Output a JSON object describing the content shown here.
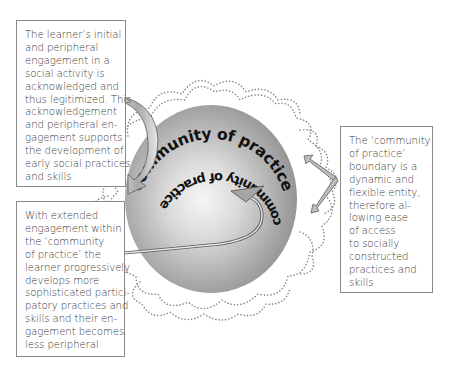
{
  "diagram": {
    "center_label_top": "community of practice",
    "center_label_bottom": "community of practice",
    "colors": {
      "sphere_edge": "#8c8c8c",
      "sphere_highlight": "#f4f4f4",
      "dotted_boundary": "#8a8a8a",
      "arrow_fill": "#b9b9b9",
      "arrow_stroke": "#6a6a6a",
      "label_text": "#111111",
      "box_border": "#8a8a8a",
      "box_text": "#3a3a3a"
    }
  },
  "boxes": {
    "top_left": {
      "lines": [
        "The learner’s initial",
        "and peripheral",
        "engagement in a",
        "social activity is",
        "acknowledged and",
        "thus legitimized. This",
        "acknowledgement",
        "and peripheral en-",
        "gagement supports",
        "the development of",
        "early social practices",
        "and skills"
      ]
    },
    "bottom_left": {
      "lines": [
        "With extended",
        "engagement within",
        "the ‘community",
        "of practice’ the",
        "learner progressively",
        "develops more",
        "sophisticated partici-",
        "patory practices and",
        "skills and their en-",
        "gagement becomes",
        "less peripheral"
      ]
    },
    "right": {
      "lines": [
        "The ‘community",
        "of practice’",
        "boundary is a",
        "dynamic and",
        "flexible entity,",
        "therefore al-",
        "lowing ease",
        "of access",
        "to socially",
        "constructed",
        "practices and",
        "skills"
      ]
    }
  }
}
